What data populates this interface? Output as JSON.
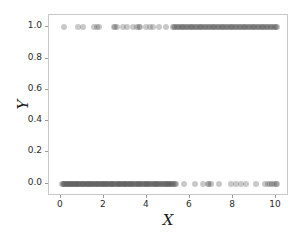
{
  "chart_data": {
    "type": "scatter",
    "title": "",
    "xlabel": "X",
    "ylabel": "Y",
    "xlim": [
      -0.55,
      10.6
    ],
    "ylim": [
      -0.08,
      1.08
    ],
    "xticks": [
      0,
      2,
      4,
      6,
      8,
      10
    ],
    "xticklabels": [
      "0",
      "2",
      "4",
      "6",
      "8",
      "10"
    ],
    "yticks": [
      0.0,
      0.2,
      0.4,
      0.6,
      0.8,
      1.0
    ],
    "yticklabels": [
      "0.0",
      "0.2",
      "0.4",
      "0.6",
      "0.8",
      "1.0"
    ],
    "grid": false,
    "legend": null,
    "marker": "circle",
    "marker_color": "#5a5a5a",
    "marker_alpha": 0.33,
    "marker_size": 6,
    "frame_color": "#c9c9c9",
    "background": "#ffffff",
    "series": [
      {
        "name": "class-0",
        "y_value": 0.0,
        "x": [
          0.06,
          0.09,
          0.13,
          0.17,
          0.21,
          0.24,
          0.28,
          0.31,
          0.35,
          0.38,
          0.42,
          0.46,
          0.49,
          0.53,
          0.57,
          0.6,
          0.64,
          0.68,
          0.71,
          0.75,
          0.79,
          0.82,
          0.86,
          0.9,
          0.94,
          0.97,
          1.01,
          1.05,
          1.09,
          1.12,
          1.16,
          1.2,
          1.24,
          1.27,
          1.31,
          1.35,
          1.39,
          1.43,
          1.46,
          1.5,
          1.54,
          1.58,
          1.62,
          1.66,
          1.69,
          1.73,
          1.77,
          1.81,
          1.85,
          1.89,
          1.93,
          1.97,
          2.0,
          2.04,
          2.08,
          2.12,
          2.16,
          2.2,
          2.24,
          2.28,
          2.32,
          2.36,
          2.4,
          2.44,
          2.48,
          2.52,
          2.56,
          2.6,
          2.64,
          2.68,
          2.72,
          2.76,
          2.8,
          2.84,
          2.88,
          2.92,
          2.96,
          3.0,
          3.04,
          3.08,
          3.12,
          3.16,
          3.2,
          3.24,
          3.28,
          3.32,
          3.36,
          3.4,
          3.45,
          3.49,
          3.53,
          3.57,
          3.61,
          3.65,
          3.69,
          3.73,
          3.77,
          3.81,
          3.86,
          3.9,
          3.94,
          3.98,
          4.02,
          4.06,
          4.1,
          4.15,
          4.19,
          4.23,
          4.27,
          4.31,
          4.36,
          4.4,
          4.44,
          4.48,
          4.53,
          4.57,
          4.61,
          4.65,
          4.7,
          4.74,
          4.78,
          4.83,
          4.87,
          4.91,
          4.96,
          5.0,
          5.04,
          5.09,
          5.13,
          5.18,
          5.22,
          5.27,
          5.31,
          5.36,
          5.7,
          6.25,
          6.6,
          6.82,
          6.9,
          6.98,
          7.35,
          7.9,
          8.15,
          8.35,
          8.6,
          9.05,
          9.5,
          9.62,
          9.74,
          9.82,
          9.9,
          9.98,
          10.05
        ]
      },
      {
        "name": "class-1",
        "y_value": 1.0,
        "x": [
          0.15,
          0.8,
          1.02,
          1.55,
          1.7,
          1.78,
          2.45,
          2.52,
          2.62,
          2.9,
          3.08,
          3.35,
          3.55,
          3.62,
          3.7,
          3.95,
          4.12,
          4.3,
          4.55,
          4.9,
          5.2,
          5.26,
          5.32,
          5.38,
          5.44,
          5.5,
          5.56,
          5.62,
          5.68,
          5.74,
          5.8,
          5.86,
          5.92,
          5.98,
          6.04,
          6.1,
          6.16,
          6.22,
          6.28,
          6.34,
          6.4,
          6.46,
          6.52,
          6.58,
          6.64,
          6.7,
          6.76,
          6.82,
          6.88,
          6.94,
          7.0,
          7.06,
          7.12,
          7.18,
          7.24,
          7.3,
          7.36,
          7.42,
          7.48,
          7.54,
          7.6,
          7.66,
          7.72,
          7.78,
          7.84,
          7.9,
          7.96,
          8.02,
          8.08,
          8.14,
          8.2,
          8.26,
          8.32,
          8.38,
          8.44,
          8.5,
          8.56,
          8.62,
          8.68,
          8.74,
          8.8,
          8.86,
          8.92,
          8.98,
          9.04,
          9.1,
          9.16,
          9.22,
          9.28,
          9.34,
          9.4,
          9.46,
          9.52,
          9.58,
          9.64,
          9.7,
          9.76,
          9.82,
          9.88,
          9.94,
          10.0,
          10.06
        ]
      }
    ]
  }
}
